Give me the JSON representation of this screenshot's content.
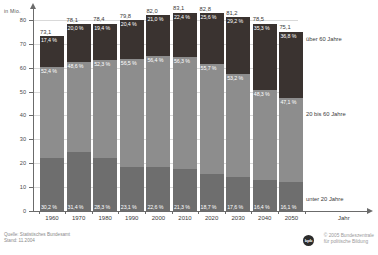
{
  "chart_data": {
    "type": "bar",
    "stacked": true,
    "title": "",
    "xlabel": "Jahr",
    "ylabel": "in Mio.",
    "ylim": [
      0,
      85
    ],
    "yticks": [
      0,
      10,
      20,
      30,
      40,
      50,
      60,
      70,
      80
    ],
    "grid": true,
    "legend_position": "right",
    "categories": [
      "1960",
      "1970",
      "1980",
      "1990",
      "2000",
      "2010",
      "2020",
      "2030",
      "2040",
      "2050"
    ],
    "totals": [
      "73,1",
      "78,1",
      "78,4",
      "79,8",
      "82,0",
      "83,1",
      "82,8",
      "81,2",
      "78,5",
      "75,1"
    ],
    "totals_numeric": [
      73.1,
      78.1,
      78.4,
      79.8,
      82.0,
      83.1,
      82.8,
      81.2,
      78.5,
      75.1
    ],
    "series": [
      {
        "name": "über 60 Jahre",
        "color": "#3a3330",
        "values": [
          17.4,
          20.0,
          19.4,
          20.4,
          21.0,
          22.4,
          25.6,
          29.2,
          35.3,
          36.8
        ],
        "labels": [
          "17,4 %",
          "20,0 %",
          "19,4 %",
          "20,4 %",
          "21,0 %",
          "22,4 %",
          "25,6 %",
          "29,2 %",
          "35,3 %",
          "36,8 %"
        ]
      },
      {
        "name": "20 bis 60 Jahre",
        "color": "#8d8d8d",
        "values": [
          52.4,
          48.6,
          52.3,
          56.5,
          56.4,
          56.3,
          55.7,
          53.2,
          48.3,
          47.1
        ],
        "labels": [
          "52,4 %",
          "48,6 %",
          "52,3 %",
          "56,5 %",
          "56,4 %",
          "56,3 %",
          "55,7 %",
          "53,2 %",
          "48,3 %",
          "47,1 %"
        ]
      },
      {
        "name": "unter 20 Jahre",
        "color": "#6e6e6e",
        "values": [
          30.2,
          31.4,
          28.3,
          23.1,
          22.6,
          21.3,
          18.7,
          17.6,
          16.4,
          16.1
        ],
        "labels": [
          "30,2 %",
          "31,4 %",
          "28,3 %",
          "23,1 %",
          "22,6 %",
          "21,3 %",
          "18,7 %",
          "17,6 %",
          "16,4 %",
          "16,1 %"
        ]
      }
    ],
    "ytick_labels": [
      "0",
      "10",
      "20",
      "30",
      "40",
      "50",
      "60",
      "70",
      "80"
    ]
  },
  "legend": {
    "old_label": "über 60 Jahre",
    "mid_label": "20 bis 60 Jahre",
    "young_label": "unter 20 Jahre"
  },
  "axes": {
    "y_unit": "in Mio.",
    "x_title": "Jahr"
  },
  "footer": {
    "source_line1": "Quelle: Statistisches Bundesamt",
    "source_line2": "Stand: 11.2004",
    "copyright_line1": "© 2005 Bundeszentrale",
    "copyright_line2": "für politische Bildung",
    "logo_text": "bpb"
  }
}
